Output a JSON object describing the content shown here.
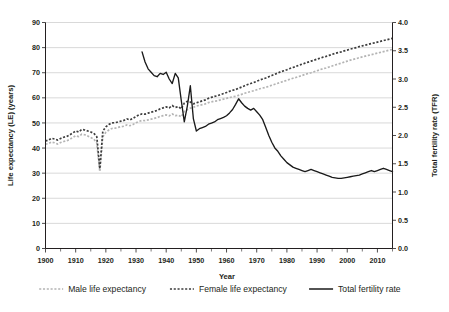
{
  "chart_data": {
    "type": "line",
    "title": "",
    "xlabel": "Year",
    "ylabel": "Life expectancy (LE) (years)",
    "y2label": "Total fertility rate (TFR)",
    "xlim": [
      1900,
      2015
    ],
    "ylim": [
      0,
      90
    ],
    "y2lim": [
      0.0,
      4.0
    ],
    "grid": true,
    "legend_position": "bottom",
    "xticks": [
      1900,
      1910,
      1920,
      1930,
      1940,
      1950,
      1960,
      1970,
      1980,
      1990,
      2000,
      2010
    ],
    "xticklabels": [
      "1900",
      "1910",
      "1920",
      "1930",
      "1940",
      "1950",
      "1960",
      "1970",
      "1980",
      "1990",
      "2000",
      "2010"
    ],
    "xminorticks": [
      1905,
      1915,
      1925,
      1935,
      1945,
      1955,
      1965,
      1975,
      1985,
      1995,
      2005,
      2015
    ],
    "yticks": [
      0,
      10,
      20,
      30,
      40,
      50,
      60,
      70,
      80,
      90
    ],
    "yticklabels": [
      "0",
      "10",
      "20",
      "30",
      "40",
      "50",
      "60",
      "70",
      "80",
      "90"
    ],
    "y2ticks": [
      0.0,
      0.5,
      1.0,
      1.5,
      2.0,
      2.5,
      3.0,
      3.5,
      4.0
    ],
    "y2ticklabels": [
      "0.0",
      "0.5",
      "1.0",
      "1.5",
      "2.0",
      "2.5",
      "3.0",
      "3.5",
      "4.0"
    ],
    "series": [
      {
        "name": "Male life expectancy",
        "axis": "left",
        "style": "dotted",
        "color": "#b4b4b4",
        "x": [
          1900,
          1901,
          1902,
          1903,
          1904,
          1905,
          1906,
          1907,
          1908,
          1909,
          1910,
          1911,
          1912,
          1913,
          1914,
          1915,
          1916,
          1917,
          1918,
          1919,
          1920,
          1921,
          1922,
          1923,
          1924,
          1925,
          1926,
          1927,
          1928,
          1929,
          1930,
          1931,
          1932,
          1933,
          1934,
          1935,
          1936,
          1937,
          1938,
          1939,
          1940,
          1941,
          1942,
          1943,
          1944,
          1945,
          1946,
          1947,
          1948,
          1949,
          1950,
          1951,
          1952,
          1953,
          1954,
          1955,
          1956,
          1957,
          1958,
          1959,
          1960,
          1961,
          1962,
          1963,
          1964,
          1965,
          1966,
          1967,
          1968,
          1969,
          1970,
          1971,
          1972,
          1973,
          1974,
          1975,
          1976,
          1977,
          1978,
          1979,
          1980,
          1981,
          1982,
          1983,
          1984,
          1985,
          1986,
          1987,
          1988,
          1989,
          1990,
          1991,
          1992,
          1993,
          1994,
          1995,
          1996,
          1997,
          1998,
          1999,
          2000,
          2001,
          2002,
          2003,
          2004,
          2005,
          2006,
          2007,
          2008,
          2009,
          2010,
          2011,
          2012,
          2013,
          2014,
          2015
        ],
        "values": [
          41.5,
          41.8,
          42.4,
          42.1,
          41.6,
          42.2,
          42.6,
          42.9,
          43.4,
          44.2,
          44.9,
          44.6,
          45.5,
          45.3,
          44.8,
          44.2,
          43.6,
          42.0,
          30.6,
          44.5,
          46.3,
          47.2,
          47.8,
          47.9,
          48.2,
          48.5,
          48.7,
          49.2,
          48.9,
          49.4,
          50.1,
          50.6,
          51.0,
          50.9,
          51.2,
          51.5,
          51.8,
          52.1,
          52.6,
          52.9,
          53.2,
          52.8,
          53.6,
          52.9,
          53.1,
          52.4,
          54.6,
          55.3,
          55.9,
          56.2,
          56.8,
          57.0,
          57.3,
          57.6,
          58.1,
          58.4,
          58.7,
          58.8,
          59.2,
          59.5,
          59.8,
          60.1,
          60.4,
          60.6,
          61.0,
          61.4,
          61.8,
          62.2,
          62.5,
          62.8,
          63.2,
          63.6,
          63.9,
          64.2,
          64.6,
          65.0,
          65.4,
          65.8,
          66.2,
          66.6,
          67.0,
          67.4,
          67.8,
          68.1,
          68.5,
          68.9,
          69.3,
          69.7,
          70.0,
          70.4,
          70.8,
          71.2,
          71.6,
          71.9,
          72.3,
          72.7,
          73.1,
          73.5,
          73.8,
          74.2,
          74.6,
          75.0,
          75.3,
          75.6,
          76.0,
          76.3,
          76.6,
          76.9,
          77.2,
          77.5,
          77.8,
          78.1,
          78.4,
          78.7,
          79.0,
          79.3
        ]
      },
      {
        "name": "Female life expectancy",
        "axis": "left",
        "style": "dotted",
        "color": "#3d3d3d",
        "x": [
          1900,
          1901,
          1902,
          1903,
          1904,
          1905,
          1906,
          1907,
          1908,
          1909,
          1910,
          1911,
          1912,
          1913,
          1914,
          1915,
          1916,
          1917,
          1918,
          1919,
          1920,
          1921,
          1922,
          1923,
          1924,
          1925,
          1926,
          1927,
          1928,
          1929,
          1930,
          1931,
          1932,
          1933,
          1934,
          1935,
          1936,
          1937,
          1938,
          1939,
          1940,
          1941,
          1942,
          1943,
          1944,
          1945,
          1946,
          1947,
          1948,
          1949,
          1950,
          1951,
          1952,
          1953,
          1954,
          1955,
          1956,
          1957,
          1958,
          1959,
          1960,
          1961,
          1962,
          1963,
          1964,
          1965,
          1966,
          1967,
          1968,
          1969,
          1970,
          1971,
          1972,
          1973,
          1974,
          1975,
          1976,
          1977,
          1978,
          1979,
          1980,
          1981,
          1982,
          1983,
          1984,
          1985,
          1986,
          1987,
          1988,
          1989,
          1990,
          1991,
          1992,
          1993,
          1994,
          1995,
          1996,
          1997,
          1998,
          1999,
          2000,
          2001,
          2002,
          2003,
          2004,
          2005,
          2006,
          2007,
          2008,
          2009,
          2010,
          2011,
          2012,
          2013,
          2014,
          2015
        ],
        "values": [
          42.8,
          43.2,
          43.9,
          43.6,
          43.2,
          43.8,
          44.3,
          44.6,
          45.2,
          46.0,
          46.8,
          46.4,
          47.4,
          47.2,
          46.8,
          46.4,
          45.9,
          44.5,
          31.7,
          46.8,
          48.4,
          49.4,
          50.0,
          50.1,
          50.4,
          50.7,
          51.0,
          51.6,
          51.2,
          51.8,
          52.6,
          53.2,
          53.6,
          53.5,
          53.9,
          54.3,
          54.6,
          55.0,
          55.6,
          56.0,
          56.4,
          56.0,
          56.9,
          56.2,
          56.5,
          55.6,
          57.9,
          58.6,
          58.3,
          57.6,
          58.0,
          58.4,
          58.8,
          59.2,
          59.8,
          60.2,
          60.6,
          60.8,
          61.3,
          61.7,
          62.1,
          62.6,
          63.0,
          63.3,
          63.8,
          64.3,
          64.8,
          65.3,
          65.7,
          66.1,
          66.6,
          67.1,
          67.5,
          67.9,
          68.4,
          68.9,
          69.4,
          69.9,
          70.4,
          70.8,
          71.2,
          71.7,
          72.1,
          72.5,
          73.0,
          73.4,
          73.8,
          74.2,
          74.6,
          75.0,
          75.4,
          75.8,
          76.2,
          76.5,
          76.9,
          77.3,
          77.7,
          78.0,
          78.3,
          78.7,
          79.0,
          79.4,
          79.7,
          80.0,
          80.4,
          80.7,
          81.0,
          81.3,
          81.6,
          81.9,
          82.2,
          82.5,
          82.8,
          83.1,
          83.4,
          83.7
        ]
      },
      {
        "name": "Total fertility rate",
        "axis": "right",
        "style": "solid",
        "color": "#1a1a1a",
        "x": [
          1932,
          1933,
          1934,
          1935,
          1936,
          1937,
          1938,
          1939,
          1940,
          1941,
          1942,
          1943,
          1944,
          1945,
          1946,
          1947,
          1948,
          1949,
          1950,
          1951,
          1952,
          1953,
          1954,
          1955,
          1956,
          1957,
          1958,
          1959,
          1960,
          1961,
          1962,
          1963,
          1964,
          1965,
          1966,
          1967,
          1968,
          1969,
          1970,
          1971,
          1972,
          1973,
          1974,
          1975,
          1976,
          1977,
          1978,
          1979,
          1980,
          1981,
          1982,
          1983,
          1984,
          1985,
          1986,
          1987,
          1988,
          1989,
          1990,
          1991,
          1992,
          1993,
          1994,
          1995,
          1996,
          1997,
          1998,
          1999,
          2000,
          2001,
          2002,
          2003,
          2004,
          2005,
          2006,
          2007,
          2008,
          2009,
          2010,
          2011,
          2012,
          2013,
          2014,
          2015
        ],
        "values": [
          3.48,
          3.3,
          3.18,
          3.12,
          3.06,
          3.04,
          3.1,
          3.08,
          3.12,
          3.0,
          2.92,
          3.1,
          3.02,
          2.62,
          2.24,
          2.52,
          2.88,
          2.3,
          2.08,
          2.12,
          2.14,
          2.16,
          2.2,
          2.22,
          2.24,
          2.28,
          2.3,
          2.32,
          2.35,
          2.4,
          2.46,
          2.55,
          2.65,
          2.58,
          2.52,
          2.48,
          2.45,
          2.48,
          2.42,
          2.36,
          2.28,
          2.14,
          2.0,
          1.88,
          1.78,
          1.72,
          1.64,
          1.58,
          1.52,
          1.48,
          1.44,
          1.42,
          1.4,
          1.38,
          1.36,
          1.38,
          1.4,
          1.38,
          1.36,
          1.34,
          1.32,
          1.3,
          1.28,
          1.26,
          1.25,
          1.24,
          1.24,
          1.25,
          1.26,
          1.27,
          1.28,
          1.29,
          1.3,
          1.32,
          1.34,
          1.36,
          1.38,
          1.36,
          1.38,
          1.4,
          1.42,
          1.4,
          1.38,
          1.36
        ]
      }
    ]
  },
  "legend": {
    "items": [
      {
        "label": "Male life expectancy",
        "style": "dotted",
        "color": "#b4b4b4"
      },
      {
        "label": "Female life expectancy",
        "style": "dotted",
        "color": "#3d3d3d"
      },
      {
        "label": "Total fertility rate",
        "style": "solid",
        "color": "#1a1a1a"
      }
    ]
  }
}
